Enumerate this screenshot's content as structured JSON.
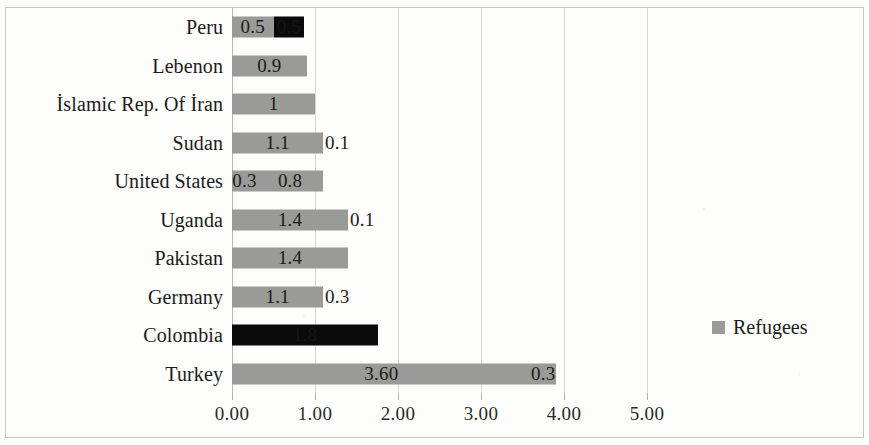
{
  "chart_data": {
    "type": "bar",
    "orientation": "horizontal",
    "stacked": true,
    "title": "",
    "xlabel": "",
    "ylabel": "",
    "xlim": [
      0,
      5.9
    ],
    "xticks": [
      "0.00",
      "1.00",
      "2.00",
      "3.00",
      "4.00",
      "5.00"
    ],
    "xtick_values": [
      0,
      1,
      2,
      3,
      4,
      5
    ],
    "grid": true,
    "legend": {
      "position": "right",
      "entries": [
        {
          "label": "Refugees",
          "color": "#9a9a98",
          "marker": "square"
        }
      ]
    },
    "categories": [
      "Peru",
      "Lebenon",
      "İslamic Rep. Of İran",
      "Sudan",
      "United States",
      "Uganda",
      "Pakistan",
      "Germany",
      "Colombia",
      "Turkey"
    ],
    "rows": [
      {
        "category": "Peru",
        "segments": [
          {
            "value": 0.5,
            "label": "0.5",
            "color": "#9a9a98",
            "label_inside": true
          },
          {
            "value": 0.37,
            "label": "0.5",
            "color": "#0b0b0b",
            "label_inside": true
          }
        ],
        "total": 0.87
      },
      {
        "category": "Lebenon",
        "segments": [
          {
            "value": 0.9,
            "label": "0.9",
            "color": "#9a9a98",
            "label_inside": true
          }
        ],
        "total": 0.9
      },
      {
        "category": "İslamic Rep. Of İran",
        "segments": [
          {
            "value": 1.0,
            "label": "1",
            "color": "#9a9a98",
            "label_inside": true
          }
        ],
        "total": 1.0
      },
      {
        "category": "Sudan",
        "segments": [
          {
            "value": 1.1,
            "label": "1.1",
            "color": "#9a9a98",
            "label_inside": true
          },
          {
            "value": 0.0,
            "label": "0.1",
            "color": "#9a9a98",
            "label_inside": false
          }
        ],
        "total": 1.1
      },
      {
        "category": "United States",
        "segments": [
          {
            "value": 0.3,
            "label": "0.3",
            "color": "#9a9a98",
            "label_inside": true
          },
          {
            "value": 0.8,
            "label": "0.8",
            "color": "#9a9a98",
            "label_inside": true
          }
        ],
        "total": 1.1
      },
      {
        "category": "Uganda",
        "segments": [
          {
            "value": 1.4,
            "label": "1.4",
            "color": "#9a9a98",
            "label_inside": true
          },
          {
            "value": 0.0,
            "label": "0.1",
            "color": "#9a9a98",
            "label_inside": false
          }
        ],
        "total": 1.4
      },
      {
        "category": "Pakistan",
        "segments": [
          {
            "value": 1.4,
            "label": "1.4",
            "color": "#9a9a98",
            "label_inside": true
          }
        ],
        "total": 1.4
      },
      {
        "category": "Germany",
        "segments": [
          {
            "value": 1.1,
            "label": "1.1",
            "color": "#9a9a98",
            "label_inside": true
          },
          {
            "value": 0.0,
            "label": "0.3",
            "color": "#9a9a98",
            "label_inside": false
          }
        ],
        "total": 1.1
      },
      {
        "category": "Colombia",
        "segments": [
          {
            "value": 1.76,
            "label": "1.8",
            "color": "#0b0b0b",
            "label_inside": true
          }
        ],
        "total": 1.76
      },
      {
        "category": "Turkey",
        "segments": [
          {
            "value": 3.6,
            "label": "3.60",
            "color": "#9a9a98",
            "label_inside": true
          },
          {
            "value": 0.3,
            "label": "0.3",
            "color": "#9a9a98",
            "label_inside": true
          }
        ],
        "total": 3.9
      }
    ]
  }
}
